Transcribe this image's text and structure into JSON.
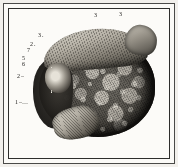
{
  "plate": {
    "kind": "anatomical-engraving",
    "subject": "nodular liver specimen",
    "background_color": "#fcfbf8",
    "ink_color": "#1d1c1a",
    "frame": {
      "outer_rule_color": "#4a4a48",
      "inner_rule_color": "#2e2e2c",
      "margin_color": "#f2f0ec"
    }
  },
  "figure": {
    "parts": [
      {
        "name": "superior-ridge",
        "tone": "pale-grey"
      },
      {
        "name": "apex-lobe",
        "tone": "mid-grey"
      },
      {
        "name": "nodular-surface",
        "tone": "dark-stippled"
      },
      {
        "name": "hilum",
        "tone": "pale-centre"
      },
      {
        "name": "radiating-strands",
        "tone": "white-lines"
      },
      {
        "name": "pendant-lobe",
        "tone": "pale-grey"
      },
      {
        "name": "left-shadow-mass",
        "tone": "black"
      }
    ]
  },
  "reference_labels": [
    {
      "id": "top-left",
      "text": "3",
      "lead": "",
      "x": 94,
      "y": 12
    },
    {
      "id": "top-right",
      "text": "3",
      "lead": "",
      "x": 119,
      "y": 11
    },
    {
      "id": "upper-left",
      "text": "3",
      "lead": ".",
      "x": 38,
      "y": 32
    },
    {
      "id": "left-2a",
      "text": "2",
      "lead": ".",
      "x": 30,
      "y": 41
    },
    {
      "id": "left-7",
      "text": "7",
      "lead": "",
      "x": 27,
      "y": 47
    },
    {
      "id": "left-5",
      "text": "5",
      "lead": "",
      "x": 22,
      "y": 55
    },
    {
      "id": "left-6",
      "text": "6",
      "lead": "",
      "x": 22,
      "y": 61
    },
    {
      "id": "left-2b",
      "text": "2",
      "lead": "–",
      "x": 17,
      "y": 73
    },
    {
      "id": "lower-left-1",
      "text": "1",
      "lead": "–…",
      "x": 15,
      "y": 99
    }
  ]
}
